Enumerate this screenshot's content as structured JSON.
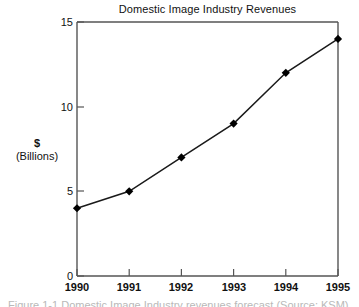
{
  "chart_data": {
    "type": "line",
    "title": "Domestic Image Industry Revenues",
    "xlabel": "",
    "ylabel": "$ (Billions)",
    "ylabel_line1": "$",
    "ylabel_line2": "(Billions)",
    "categories": [
      "1990",
      "1991",
      "1992",
      "1993",
      "1994",
      "1995"
    ],
    "x": [
      1990,
      1991,
      1992,
      1993,
      1994,
      1995
    ],
    "values": [
      4,
      5,
      7,
      9,
      12,
      14
    ],
    "series": [
      {
        "name": "Domestic Image Industry Revenues",
        "values": [
          4,
          5,
          7,
          9,
          12,
          14
        ]
      }
    ],
    "ylim": [
      0,
      15
    ],
    "xlim": [
      1990,
      1995
    ],
    "yticks": [
      0,
      5,
      10,
      15
    ],
    "ytick_labels": [
      "0",
      "5",
      "10",
      "15"
    ],
    "xticks": [
      1990,
      1991,
      1992,
      1993,
      1994,
      1995
    ],
    "xtick_labels": [
      "1990",
      "1991",
      "1992",
      "1993",
      "1994",
      "1995"
    ],
    "grid": false,
    "legend": false,
    "legend_position": "none",
    "marker": "diamond",
    "line_color": "#1a1a1a",
    "marker_color": "#000000",
    "axis_color": "#555555",
    "background_color": "#ffffff"
  },
  "caption": {
    "clipped_text": "Figure 1-1   Domestic Image Industry revenues forecast (Source: KSM)"
  }
}
